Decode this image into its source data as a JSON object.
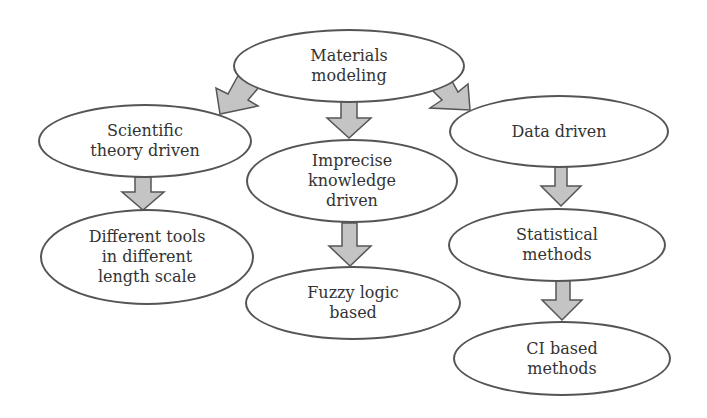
{
  "diagram": {
    "colors": {
      "arrow_fill": "#c4c4c4",
      "arrow_stroke": "#555555",
      "node_stroke": "#555555",
      "text": "#333333"
    },
    "nodes": [
      {
        "id": "root",
        "label": "Materials\nmodeling"
      },
      {
        "id": "scientific",
        "label": "Scientific\ntheory driven"
      },
      {
        "id": "imprecise",
        "label": "Imprecise\nknowledge\ndriven"
      },
      {
        "id": "data",
        "label": "Data driven"
      },
      {
        "id": "tools",
        "label": "Different tools\nin different\nlength scale"
      },
      {
        "id": "fuzzy",
        "label": "Fuzzy logic\nbased"
      },
      {
        "id": "statistical",
        "label": "Statistical\nmethods"
      },
      {
        "id": "ci",
        "label": "CI based\nmethods"
      }
    ],
    "edges": [
      {
        "from": "root",
        "to": "scientific"
      },
      {
        "from": "root",
        "to": "imprecise"
      },
      {
        "from": "root",
        "to": "data"
      },
      {
        "from": "scientific",
        "to": "tools"
      },
      {
        "from": "imprecise",
        "to": "fuzzy"
      },
      {
        "from": "data",
        "to": "statistical"
      },
      {
        "from": "statistical",
        "to": "ci"
      }
    ]
  }
}
